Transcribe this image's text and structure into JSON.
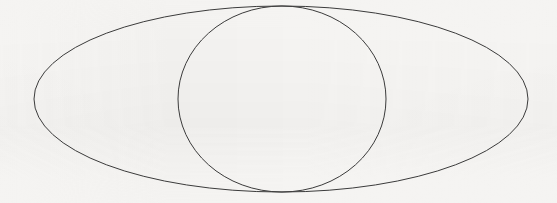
{
  "figure": {
    "width": 557,
    "height": 203,
    "background_color": "#f5f4f2",
    "stroke_color": "#3b3b3b",
    "stroke_width": 1,
    "fill": "none"
  },
  "shapes": [
    {
      "id": "outer-ellipse",
      "name": "wide-ellipse",
      "type": "ellipse",
      "cx": 281,
      "cy": 99,
      "rx": 247,
      "ry": 93,
      "left": 34,
      "right": 528,
      "top": 6,
      "bottom": 192,
      "stroke": "#3b3b3b",
      "stroke_width": 1,
      "fill": "none"
    },
    {
      "id": "inner-ellipse",
      "name": "round-ellipse",
      "type": "ellipse",
      "cx": 282,
      "cy": 99,
      "rx": 104,
      "ry": 93,
      "left": 178,
      "right": 386,
      "top": 6,
      "bottom": 192,
      "stroke": "#3b3b3b",
      "stroke_width": 1,
      "fill": "none"
    }
  ],
  "intersections": [
    {
      "id": "top-intersection",
      "name": "top-crossing-point",
      "x": 281,
      "y": 6
    },
    {
      "id": "bottom-intersection",
      "name": "bottom-crossing-point",
      "x": 281,
      "y": 192
    }
  ],
  "labels": {
    "has_text": false,
    "text_items": []
  }
}
